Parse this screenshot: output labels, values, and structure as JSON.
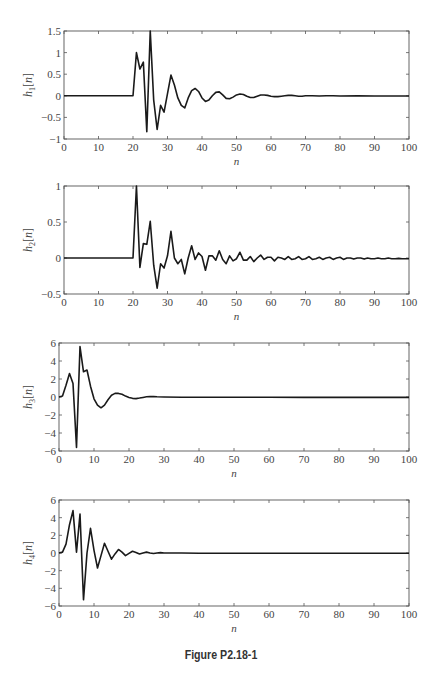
{
  "figure": {
    "caption": "Figure P2.18-1"
  },
  "chart_data": [
    {
      "type": "line",
      "title": "",
      "xlabel": "n",
      "ylabel": "h1[n]",
      "ylabel_base": "h",
      "ylabel_sub": "1",
      "xlim": [
        0,
        100
      ],
      "ylim": [
        -1,
        1.5
      ],
      "xticks": [
        0,
        10,
        20,
        30,
        40,
        50,
        60,
        70,
        80,
        90,
        100
      ],
      "yticks": [
        -1,
        -0.5,
        0,
        0.5,
        1,
        1.5
      ],
      "ytick_labels": [
        "−1",
        "−0.5",
        "0",
        "0.5",
        "1",
        "1.5"
      ],
      "grid": false,
      "box": {
        "left": 64,
        "top": 31,
        "right": 409,
        "bottom": 139
      },
      "x": [
        0,
        20,
        21,
        22,
        23,
        24,
        25,
        26,
        27,
        28,
        29,
        30,
        31,
        32,
        33,
        34,
        35,
        36,
        37,
        38,
        39,
        40,
        41,
        42,
        43,
        44,
        45,
        46,
        47,
        48,
        49,
        50,
        51,
        52,
        53,
        54,
        55,
        56,
        57,
        58,
        59,
        60,
        61,
        62,
        63,
        64,
        65,
        66,
        67,
        68,
        69,
        70,
        72,
        74,
        76,
        78,
        80,
        85,
        90,
        95,
        100
      ],
      "y": [
        0,
        0,
        1.0,
        0.62,
        0.78,
        -0.83,
        1.5,
        -0.1,
        -0.78,
        -0.22,
        -0.38,
        0.05,
        0.48,
        0.25,
        -0.05,
        -0.22,
        -0.28,
        -0.05,
        0.12,
        0.17,
        0.1,
        -0.05,
        -0.13,
        -0.1,
        0.0,
        0.08,
        0.09,
        0.02,
        -0.06,
        -0.07,
        -0.03,
        0.02,
        0.04,
        0.03,
        -0.01,
        -0.04,
        -0.04,
        -0.01,
        0.02,
        0.02,
        0.01,
        -0.01,
        -0.02,
        -0.02,
        -0.01,
        0.0,
        0.01,
        0.01,
        0.0,
        -0.01,
        -0.01,
        0.0,
        0.0,
        -0.005,
        0.0,
        0.0,
        -0.005,
        0.0,
        -0.005,
        -0.005,
        -0.005
      ]
    },
    {
      "type": "line",
      "title": "",
      "xlabel": "n",
      "ylabel": "h2[n]",
      "ylabel_base": "h",
      "ylabel_sub": "2",
      "xlim": [
        0,
        100
      ],
      "ylim": [
        -0.5,
        1
      ],
      "xticks": [
        0,
        10,
        20,
        30,
        40,
        50,
        60,
        70,
        80,
        90,
        100
      ],
      "yticks": [
        -0.5,
        0,
        0.5,
        1
      ],
      "ytick_labels": [
        "−0.5",
        "0",
        "0.5",
        "1"
      ],
      "grid": false,
      "box": {
        "left": 64,
        "top": 186,
        "right": 409,
        "bottom": 294
      },
      "x": [
        0,
        20,
        21,
        22,
        23,
        24,
        25,
        26,
        27,
        28,
        29,
        30,
        31,
        32,
        33,
        34,
        35,
        36,
        37,
        38,
        39,
        40,
        41,
        42,
        43,
        44,
        45,
        46,
        47,
        48,
        49,
        50,
        51,
        52,
        53,
        54,
        55,
        56,
        57,
        58,
        59,
        60,
        61,
        62,
        63,
        64,
        65,
        66,
        67,
        68,
        69,
        70,
        71,
        72,
        73,
        74,
        75,
        76,
        77,
        78,
        79,
        80,
        81,
        82,
        83,
        84,
        85,
        86,
        87,
        88,
        89,
        90,
        91,
        92,
        93,
        94,
        95,
        96,
        97,
        98,
        99,
        100
      ],
      "y": [
        0,
        0,
        1.0,
        -0.13,
        0.2,
        0.19,
        0.51,
        -0.1,
        -0.42,
        -0.08,
        -0.14,
        0.03,
        0.37,
        0.0,
        -0.08,
        -0.02,
        -0.22,
        0.0,
        0.17,
        -0.02,
        0.07,
        0.02,
        -0.17,
        0.03,
        0.03,
        -0.03,
        0.1,
        -0.02,
        -0.08,
        0.03,
        -0.04,
        -0.01,
        0.08,
        -0.03,
        -0.03,
        0.02,
        -0.05,
        0.0,
        0.04,
        -0.02,
        0.01,
        0.01,
        -0.04,
        0.01,
        0.0,
        -0.02,
        0.02,
        -0.02,
        -0.01,
        0.02,
        -0.02,
        -0.01,
        0.02,
        -0.02,
        -0.01,
        0.01,
        -0.02,
        0.0,
        0.01,
        -0.02,
        0.0,
        0.01,
        -0.02,
        0.0,
        0.0,
        -0.015,
        0.0,
        0.0,
        -0.015,
        0.0,
        -0.01,
        -0.01,
        0.0,
        -0.01,
        -0.01,
        0.0,
        -0.01,
        -0.01,
        -0.005,
        -0.01,
        -0.01,
        -0.01
      ]
    },
    {
      "type": "line",
      "title": "",
      "xlabel": "n",
      "ylabel": "h3[n]",
      "ylabel_base": "h",
      "ylabel_sub": "3",
      "xlim": [
        0,
        100
      ],
      "ylim": [
        -6,
        6
      ],
      "xticks": [
        0,
        10,
        20,
        30,
        40,
        50,
        60,
        70,
        80,
        90,
        100
      ],
      "yticks": [
        -6,
        -4,
        -2,
        0,
        2,
        4,
        6
      ],
      "ytick_labels": [
        "−6",
        "−4",
        "−2",
        "0",
        "2",
        "4",
        "6"
      ],
      "grid": false,
      "box": {
        "left": 59,
        "top": 343,
        "right": 409,
        "bottom": 451
      },
      "x": [
        0,
        1,
        2,
        3,
        4,
        5,
        6,
        7,
        8,
        9,
        10,
        11,
        12,
        13,
        14,
        15,
        16,
        17,
        18,
        19,
        20,
        21,
        22,
        23,
        24,
        25,
        26,
        27,
        28,
        30,
        35,
        40,
        50,
        60,
        70,
        80,
        90,
        100
      ],
      "y": [
        0,
        0.1,
        1.3,
        2.6,
        1.5,
        -5.6,
        5.6,
        2.8,
        3.0,
        1.2,
        -0.2,
        -0.9,
        -1.2,
        -0.9,
        -0.3,
        0.2,
        0.4,
        0.4,
        0.3,
        0.1,
        -0.05,
        -0.15,
        -0.18,
        -0.12,
        -0.05,
        0.02,
        0.05,
        0.04,
        0.02,
        0.0,
        -0.02,
        -0.03,
        -0.03,
        -0.03,
        -0.04,
        -0.04,
        -0.04,
        -0.04
      ]
    },
    {
      "type": "line",
      "title": "",
      "xlabel": "n",
      "ylabel": "h4[n]",
      "ylabel_base": "h",
      "ylabel_sub": "4",
      "xlim": [
        0,
        100
      ],
      "ylim": [
        -6,
        6
      ],
      "xticks": [
        0,
        10,
        20,
        30,
        40,
        50,
        60,
        70,
        80,
        90,
        100
      ],
      "yticks": [
        -6,
        -4,
        -2,
        0,
        2,
        4,
        6
      ],
      "ytick_labels": [
        "−6",
        "−4",
        "−2",
        "0",
        "2",
        "4",
        "6"
      ],
      "grid": false,
      "box": {
        "left": 59,
        "top": 500,
        "right": 409,
        "bottom": 606
      },
      "x": [
        0,
        1,
        2,
        3,
        4,
        5,
        6,
        7,
        8,
        9,
        10,
        11,
        12,
        13,
        14,
        15,
        16,
        17,
        18,
        19,
        20,
        21,
        22,
        23,
        24,
        25,
        26,
        27,
        28,
        29,
        30,
        35,
        40,
        50,
        60,
        70,
        80,
        90,
        100
      ],
      "y": [
        0,
        0.1,
        1.0,
        3.2,
        4.8,
        0.1,
        4.4,
        -5.3,
        0.0,
        2.8,
        0.3,
        -1.7,
        -0.3,
        1.1,
        0.2,
        -0.7,
        -0.1,
        0.4,
        0.1,
        -0.3,
        -0.05,
        0.2,
        0.05,
        -0.12,
        0.0,
        0.1,
        0.0,
        -0.06,
        0.0,
        0.04,
        0.0,
        0.0,
        -0.02,
        -0.02,
        -0.03,
        -0.03,
        -0.03,
        -0.03,
        -0.03
      ]
    }
  ]
}
